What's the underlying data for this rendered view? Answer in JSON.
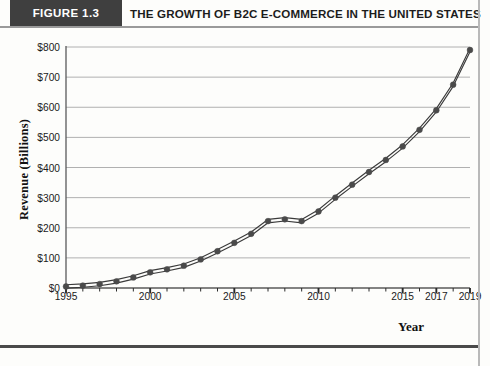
{
  "header": {
    "figure_tag": "FIGURE 1.3",
    "title": "THE GROWTH OF B2C E-COMMERCE IN THE UNITED STATES"
  },
  "footer": {
    "caption": ""
  },
  "colors": {
    "header_block": "#3f3f3f",
    "line": "#3a3a3a",
    "marker": "#4a4a4a",
    "grid": "#b0b0b0",
    "axis": "#5a5a5a",
    "page": "#fdfdfb"
  },
  "chart_data": {
    "type": "line",
    "title": "THE GROWTH OF B2C E-COMMERCE IN THE UNITED STATES",
    "xlabel": "Year",
    "ylabel": "Revenue (Billions)",
    "ylim": [
      0,
      800
    ],
    "xlim": [
      1995,
      2019
    ],
    "yticks": [
      0,
      100,
      200,
      300,
      400,
      500,
      600,
      700,
      800
    ],
    "ytick_labels": [
      "$0",
      "$100",
      "$200",
      "$300",
      "$400",
      "$500",
      "$600",
      "$700",
      "$800"
    ],
    "xticks": [
      1995,
      1996,
      1997,
      1998,
      1999,
      2000,
      2001,
      2002,
      2003,
      2004,
      2005,
      2006,
      2007,
      2008,
      2009,
      2010,
      2011,
      2012,
      2013,
      2014,
      2015,
      2016,
      2017,
      2018,
      2019
    ],
    "xtick_labels": [
      "1995",
      "2000",
      "2005",
      "2010",
      "2015",
      "2017",
      "2019"
    ],
    "xtick_label_values": [
      1995,
      2000,
      2005,
      2010,
      2015,
      2017,
      2019
    ],
    "grid": "horizontal",
    "legend": "none",
    "marker": "circle",
    "line_style": "double-parallel",
    "x": [
      1995,
      1996,
      1997,
      1998,
      1999,
      2000,
      2001,
      2002,
      2003,
      2004,
      2005,
      2006,
      2007,
      2008,
      2009,
      2010,
      2011,
      2012,
      2013,
      2014,
      2015,
      2016,
      2017,
      2018,
      2019
    ],
    "values": [
      5,
      8,
      13,
      22,
      35,
      52,
      62,
      74,
      95,
      122,
      150,
      180,
      222,
      228,
      222,
      254,
      300,
      343,
      385,
      425,
      470,
      525,
      590,
      675,
      790
    ]
  }
}
